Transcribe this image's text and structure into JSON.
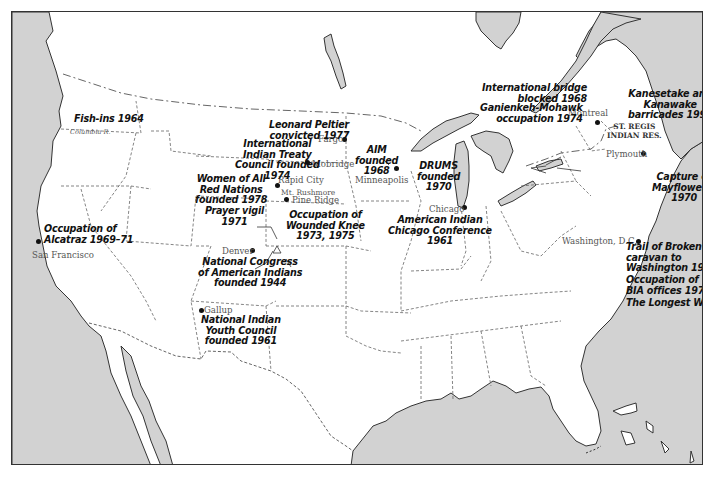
{
  "map": {
    "colors": {
      "water": "#d2d2d2",
      "land": "#ffffff",
      "coast": "#333333",
      "border": "#555555",
      "frame": "#333333"
    },
    "events": [
      {
        "id": "fish-ins",
        "text": "Fish-ins 1964"
      },
      {
        "id": "alcatraz",
        "text": "Occupation of\nAlcatraz 1969–71"
      },
      {
        "id": "peltier",
        "text": "Leonard Peltier\nconvicted 1977"
      },
      {
        "id": "iitc",
        "text": "International\nIndian Treaty\nCouncil founded\n1974"
      },
      {
        "id": "warn",
        "text": "Women of All\nRed Nations\nfounded 1978"
      },
      {
        "id": "prayer-vigil",
        "text": "Prayer vigil\n1971"
      },
      {
        "id": "wounded-knee",
        "text": "Occupation of\nWounded Knee\n1973, 1975"
      },
      {
        "id": "aim",
        "text": "AIM\nfounded\n1968"
      },
      {
        "id": "drums",
        "text": "DRUMS\nfounded\n1970"
      },
      {
        "id": "chicago-conf",
        "text": "American Indian\nChicago Conference\n1961"
      },
      {
        "id": "ncai",
        "text": "National Congress\nof American Indians\nfounded 1944"
      },
      {
        "id": "niyc",
        "text": "National Indian\nYouth Council\nfounded 1961"
      },
      {
        "id": "bridge",
        "text": "International bridge\nblocked 1968"
      },
      {
        "id": "ganienkeh",
        "text": "Ganienkeh-Mohawk\noccupation 1974"
      },
      {
        "id": "kanesetake",
        "text": "Kanesetake and\nKanawake\nbarricades 1990"
      },
      {
        "id": "mayflower",
        "text": "Capture of\nMayflower II\n1970"
      },
      {
        "id": "broken-treaties",
        "text": "Trail of Broken Treaties\ncaravan to\nWashington 1972"
      },
      {
        "id": "bia",
        "text": "Occupation of\nBIA offices 1972"
      },
      {
        "id": "longest-walk",
        "text": "The Longest Walk 1978"
      }
    ],
    "cities": [
      {
        "id": "san-francisco",
        "text": "San Francisco"
      },
      {
        "id": "fargo",
        "text": "Fargo"
      },
      {
        "id": "mobridge",
        "text": "Mobridge"
      },
      {
        "id": "rapid-city",
        "text": "Rapid City"
      },
      {
        "id": "mt-rushmore",
        "text": "Mt. Rushmore"
      },
      {
        "id": "pine-ridge",
        "text": "Pine Ridge"
      },
      {
        "id": "minneapolis",
        "text": "Minneapolis"
      },
      {
        "id": "chicago",
        "text": "Chicago"
      },
      {
        "id": "denver",
        "text": "Denver"
      },
      {
        "id": "gallup",
        "text": "Gallup"
      },
      {
        "id": "montreal",
        "text": "Montreal"
      },
      {
        "id": "plymouth",
        "text": "Plymouth"
      },
      {
        "id": "washington",
        "text": "Washington, D.C."
      }
    ],
    "features": {
      "columbia_river": "Columbia R.",
      "st_regis": "ST. REGIS\nINDIAN RES."
    }
  }
}
